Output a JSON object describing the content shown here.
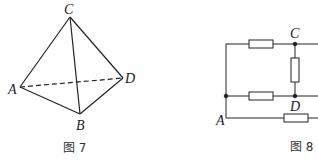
{
  "figure7": {
    "caption": "图 7",
    "vertices": {
      "A": "A",
      "B": "B",
      "C": "C",
      "D": "D"
    }
  },
  "figure8": {
    "caption": "图 8",
    "nodes": {
      "A": "A",
      "C": "C",
      "D": "D"
    }
  }
}
